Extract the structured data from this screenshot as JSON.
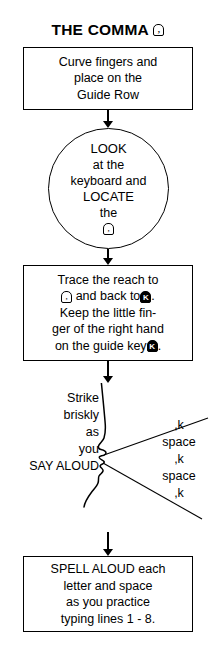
{
  "page": {
    "title": "THE COMMA",
    "title_key_icon": "comma-keycap-icon",
    "title_key_glyph": ","
  },
  "steps": {
    "guide_row": {
      "lines": [
        "Curve fingers and",
        "place on the",
        "Guide Row"
      ]
    },
    "look": {
      "lines": [
        "LOOK",
        "at the",
        "keyboard and",
        "LOCATE",
        "the"
      ],
      "key_glyph": ","
    },
    "trace": {
      "line1": "Trace the reach to",
      "line2_before": "",
      "line2_key_comma": ",",
      "line2_middle": "and back to",
      "line2_key_k": "K",
      "line2_after": ".",
      "line3": "Keep the little fin-",
      "line4": "ger of the right hand",
      "line5_before": "on the guide key",
      "line5_key_guide": "K",
      "line5_after": "."
    },
    "speak": {
      "left_lines": [
        "Strike",
        "briskly",
        "as",
        "you",
        "SAY ALOUD"
      ],
      "right_lines": [
        ",k",
        "space",
        ",k",
        "space",
        ",k"
      ]
    },
    "spell": {
      "lines": [
        "SPELL ALOUD each",
        "letter and space",
        "as you practice",
        "typing lines 1 - 8."
      ]
    }
  },
  "colors": {
    "ink": "#000000",
    "paper": "#ffffff"
  }
}
